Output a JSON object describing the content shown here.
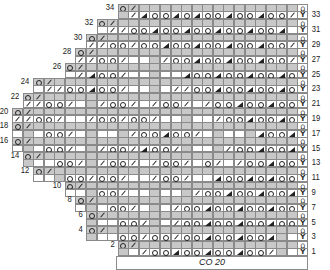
{
  "cast_on_label": "CO 20",
  "legend_symbols": {
    "o": "yarn-over",
    "/": "k2tog",
    "t": "triangle-decrease",
    "B": "bobble-edge",
    "Y": "edge-slip"
  },
  "colors": {
    "shade": "#c8c8c8",
    "grid": "#8a8a8a",
    "ink": "#222222"
  },
  "grid": {
    "cols": 28,
    "x0": 12,
    "cell_w": 10.57,
    "y_top": 4,
    "cell_h": 7.4
  },
  "rows": [
    {
      "n": 34,
      "start": 10,
      "cells": "o/..............B"
    },
    {
      "n": 33,
      "start": 10,
      "cells": "./toototootootoo/.Y"
    },
    {
      "n": 32,
      "start": 8,
      "cells": "o/................B"
    },
    {
      "n": 31,
      "start": 8,
      "cells": ".//ootootootootoot..Y"
    },
    {
      "n": 30,
      "start": 7,
      "cells": "o/..................B"
    },
    {
      "n": 29,
      "start": 7,
      "cells": "//oo/ootootootootoo/.Y"
    },
    {
      "n": 28,
      "start": 6,
      "cells": "o/....................B"
    },
    {
      "n": 27,
      "start": 6,
      "cells": "//oo/.../ootootootoo/.Y"
    },
    {
      "n": 26,
      "start": 5,
      "cells": "o/......................B"
    },
    {
      "n": 25,
      "start": 5,
      "cells": "./too/.....tootootootoo..Y"
    },
    {
      "n": 24,
      "start": 2,
      "cells": "o/........................B"
    },
    {
      "n": 23,
      "start": 2,
      "cells": ".//ootoo/....//ootootootoo/.Y"
    },
    {
      "n": 22,
      "start": 1,
      "cells": "o/..........................B"
    },
    {
      "n": 21,
      "start": 1,
      "cells": "//oo/../oo/./oo/./ootootoo/.Y"
    },
    {
      "n": 20,
      "start": 0,
      "cells": "o/..........................B"
    },
    {
      "n": 19,
      "start": 0,
      "cells": "//oo/../oo/oo/...../ootootoo..Y"
    },
    {
      "n": 18,
      "start": 0,
      "cells": "o/..........................B"
    },
    {
      "n": 17,
      "start": 0,
      "cells": "...oo/...../ootoo/.....tootoo/.Y"
    },
    {
      "n": 16,
      "start": 0,
      "cells": "o/..........................B"
    },
    {
      "n": 15,
      "start": 0,
      "cells": "...oo/../oo/too/..../ootootoo..Y"
    },
    {
      "n": 14,
      "start": 1,
      "cells": "o/..........................B"
    },
    {
      "n": 13,
      "start": 1,
      "cells": "...oo/./oo/./oo/.o/./ootootoo/.Y"
    },
    {
      "n": 12,
      "start": 2,
      "cells": "o/........................B"
    },
    {
      "n": 11,
      "start": 2,
      "cells": "...oo/oo/../oo/..toototootoo/.Y"
    },
    {
      "n": 10,
      "start": 5,
      "cells": "o/......................B"
    },
    {
      "n": 9,
      "start": 5,
      "cells": "...oo/....../ootootootoo..Y"
    },
    {
      "n": 8,
      "start": 6,
      "cells": "o/....................B"
    },
    {
      "n": 7,
      "start": 6,
      "cells": "...oo/.../ootootootoo/.Y"
    },
    {
      "n": 6,
      "start": 7,
      "cells": "o/..................B"
    },
    {
      "n": 5,
      "start": 7,
      "cells": "...oo/../ootootootoo..Y"
    },
    {
      "n": 4,
      "start": 7,
      "cells": "o/..................B"
    },
    {
      "n": 3,
      "start": 7,
      "cells": "...oo/oo/ootootoot...Y"
    },
    {
      "n": 2,
      "start": 10,
      "cells": "o/..............B"
    },
    {
      "n": 1,
      "start": 10,
      "cells": "../ootootootoo/.Y"
    }
  ]
}
